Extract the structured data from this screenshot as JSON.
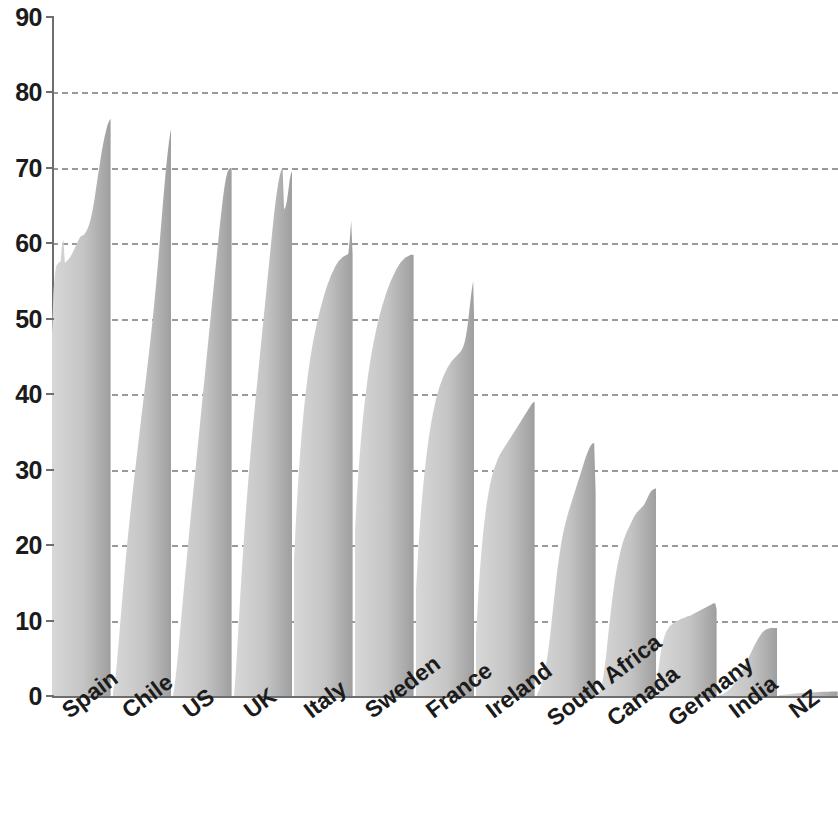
{
  "chart_data": {
    "type": "area",
    "title": "",
    "subtitle": "",
    "xlabel": "",
    "ylabel": "",
    "ylim": [
      0,
      90
    ],
    "xlim": [
      0,
      13
    ],
    "y_ticks": [
      0,
      10,
      20,
      30,
      40,
      50,
      60,
      70,
      80,
      90
    ],
    "y_tick_labels": [
      "0",
      "10",
      "20",
      "30",
      "40",
      "50",
      "60",
      "70",
      "80",
      "90"
    ],
    "grid": true,
    "grid_axis": "y",
    "grid_style": "dashed",
    "grid_color": "#9a9a9a",
    "axis_color": "#6e6e6e",
    "legend": false,
    "legend_position": "none",
    "categories": [
      "Spain",
      "Chile",
      "US",
      "UK",
      "Italy",
      "Sweden",
      "France",
      "Ireland",
      "South Africa",
      "Canada",
      "Germany",
      "India",
      "NZ"
    ],
    "series_note": "Each category is a within-country distribution profile drawn as a filled area rising left to right; values are percentages on the 0-90 axis.",
    "peak_values": [
      76.5,
      75.5,
      70.0,
      70.0,
      63.0,
      58.5,
      55.0,
      39.0,
      33.5,
      27.5,
      12.3,
      9.0,
      0.6
    ],
    "start_values": [
      48.0,
      0.5,
      0.0,
      0.0,
      18.0,
      22.0,
      14.0,
      8.0,
      0.3,
      0.2,
      3.0,
      0.1,
      0.1
    ],
    "series": [
      {
        "name": "Spain",
        "peak": 76.5,
        "profile": [
          48.0,
          53.5,
          56.0,
          57.0,
          57.3,
          57.5,
          57.6,
          59.8,
          60.5,
          57.4,
          57.6,
          57.8,
          58.0,
          58.3,
          58.6,
          59.0,
          59.4,
          59.8,
          60.2,
          60.6,
          60.9,
          61.0,
          61.1,
          61.3,
          61.6,
          62.0,
          62.5,
          63.2,
          64.0,
          65.0,
          66.2,
          67.5,
          68.8,
          70.0,
          71.2,
          72.4,
          73.4,
          74.3,
          75.1,
          75.8,
          76.2,
          76.5
        ]
      },
      {
        "name": "Chile",
        "peak": 75.5,
        "profile": [
          0.5,
          1.5,
          3.0,
          5.0,
          7.2,
          9.5,
          11.8,
          14.0,
          16.2,
          18.3,
          20.3,
          22.2,
          24.0,
          25.8,
          27.5,
          29.2,
          30.8,
          32.4,
          34.0,
          35.6,
          37.2,
          38.8,
          40.4,
          42.0,
          43.6,
          45.2,
          46.9,
          48.6,
          50.4,
          52.3,
          54.3,
          56.4,
          58.6,
          60.9,
          63.2,
          65.5,
          67.7,
          69.8,
          71.6,
          73.2,
          74.6,
          75.5
        ]
      },
      {
        "name": "US",
        "peak": 70.0,
        "profile": [
          0.0,
          1.2,
          2.8,
          4.6,
          6.6,
          8.7,
          10.8,
          12.9,
          15.0,
          17.0,
          19.0,
          21.0,
          23.0,
          24.9,
          26.8,
          28.7,
          30.6,
          32.5,
          34.4,
          36.3,
          38.2,
          40.1,
          42.0,
          43.9,
          45.8,
          47.7,
          49.6,
          51.5,
          53.4,
          55.3,
          57.2,
          59.1,
          61.0,
          62.8,
          64.5,
          66.1,
          67.5,
          68.6,
          69.4,
          69.8,
          70.0,
          70.0
        ]
      },
      {
        "name": "UK",
        "peak": 70.0,
        "profile": [
          0.0,
          2.5,
          5.5,
          8.8,
          12.0,
          15.2,
          18.2,
          21.0,
          23.7,
          26.2,
          28.6,
          30.9,
          33.1,
          35.2,
          37.2,
          39.2,
          41.1,
          43.0,
          44.9,
          46.8,
          48.7,
          50.6,
          52.5,
          54.4,
          56.3,
          58.2,
          60.1,
          62.0,
          63.8,
          65.4,
          66.8,
          68.0,
          69.0,
          69.7,
          70.0,
          64.5,
          64.8,
          65.6,
          67.0,
          68.5,
          69.4,
          69.5
        ]
      },
      {
        "name": "Italy",
        "peak": 63.0,
        "profile": [
          18.0,
          22.0,
          25.5,
          28.6,
          31.4,
          33.9,
          36.1,
          38.1,
          39.9,
          41.5,
          43.0,
          44.3,
          45.5,
          46.6,
          47.6,
          48.5,
          49.4,
          50.2,
          51.0,
          51.7,
          52.4,
          53.1,
          53.7,
          54.3,
          54.8,
          55.3,
          55.8,
          56.2,
          56.6,
          57.0,
          57.3,
          57.6,
          57.8,
          58.0,
          58.2,
          58.3,
          58.4,
          58.5,
          58.6,
          60.5,
          63.0,
          58.5
        ]
      },
      {
        "name": "Sweden",
        "peak": 58.5,
        "profile": [
          22.0,
          25.5,
          28.5,
          31.2,
          33.6,
          35.7,
          37.6,
          39.3,
          40.9,
          42.3,
          43.6,
          44.8,
          45.9,
          46.9,
          47.8,
          48.7,
          49.5,
          50.3,
          51.0,
          51.7,
          52.3,
          52.9,
          53.5,
          54.0,
          54.5,
          55.0,
          55.4,
          55.8,
          56.2,
          56.6,
          56.9,
          57.2,
          57.5,
          57.7,
          57.9,
          58.1,
          58.2,
          58.3,
          58.4,
          58.5,
          58.5,
          58.5
        ]
      },
      {
        "name": "France",
        "peak": 55.0,
        "profile": [
          14.0,
          17.5,
          20.6,
          23.3,
          25.7,
          27.8,
          29.7,
          31.4,
          32.9,
          34.3,
          35.5,
          36.6,
          37.6,
          38.5,
          39.3,
          40.0,
          40.7,
          41.3,
          41.8,
          42.3,
          42.7,
          43.1,
          43.5,
          43.8,
          44.1,
          44.4,
          44.6,
          44.8,
          45.0,
          45.2,
          45.4,
          45.6,
          45.9,
          46.3,
          46.9,
          47.8,
          49.0,
          50.6,
          52.3,
          53.8,
          55.0,
          47.5
        ]
      },
      {
        "name": "Ireland",
        "peak": 39.0,
        "profile": [
          8.0,
          11.5,
          14.6,
          17.3,
          19.6,
          21.6,
          23.3,
          24.8,
          26.1,
          27.2,
          28.2,
          29.0,
          29.7,
          30.3,
          30.8,
          31.3,
          31.7,
          32.1,
          32.4,
          32.7,
          33.0,
          33.3,
          33.6,
          33.9,
          34.2,
          34.5,
          34.8,
          35.1,
          35.4,
          35.7,
          36.0,
          36.3,
          36.6,
          36.9,
          37.2,
          37.5,
          37.8,
          38.1,
          38.4,
          38.7,
          38.9,
          39.0
        ]
      },
      {
        "name": "South Africa",
        "peak": 33.5,
        "profile": [
          0.3,
          0.6,
          1.0,
          1.5,
          2.1,
          2.9,
          3.8,
          4.9,
          6.2,
          7.7,
          9.4,
          11.2,
          13.0,
          14.7,
          16.3,
          17.8,
          19.1,
          20.3,
          21.3,
          22.2,
          23.0,
          23.7,
          24.4,
          25.0,
          25.6,
          26.2,
          26.8,
          27.4,
          28.0,
          28.6,
          29.2,
          29.8,
          30.4,
          31.0,
          31.6,
          32.1,
          32.6,
          33.0,
          33.3,
          33.5,
          33.5,
          27.0
        ]
      },
      {
        "name": "Canada",
        "peak": 27.5,
        "profile": [
          0.2,
          0.5,
          1.0,
          1.8,
          2.9,
          4.3,
          6.0,
          7.8,
          9.6,
          11.3,
          12.9,
          14.3,
          15.6,
          16.7,
          17.7,
          18.6,
          19.4,
          20.1,
          20.7,
          21.2,
          21.7,
          22.1,
          22.5,
          22.9,
          23.3,
          23.7,
          24.0,
          24.3,
          24.5,
          24.7,
          24.9,
          25.1,
          25.3,
          25.6,
          26.0,
          26.4,
          26.8,
          27.1,
          27.3,
          27.4,
          27.5,
          27.5
        ]
      },
      {
        "name": "Germany",
        "peak": 12.3,
        "profile": [
          3.0,
          4.6,
          5.9,
          6.9,
          7.6,
          8.2,
          8.6,
          8.9,
          9.2,
          9.4,
          9.5,
          9.7,
          9.8,
          9.9,
          10.0,
          10.1,
          10.2,
          10.3,
          10.3,
          10.4,
          10.5,
          10.6,
          10.6,
          10.7,
          10.8,
          10.9,
          11.0,
          11.1,
          11.2,
          11.3,
          11.4,
          11.5,
          11.6,
          11.7,
          11.8,
          11.9,
          12.0,
          12.1,
          12.2,
          12.3,
          12.3,
          11.5
        ]
      },
      {
        "name": "India",
        "peak": 9.0,
        "profile": [
          0.1,
          0.15,
          0.2,
          0.3,
          0.4,
          0.5,
          0.65,
          0.8,
          1.0,
          1.2,
          1.45,
          1.7,
          2.0,
          2.3,
          2.6,
          2.95,
          3.3,
          3.65,
          4.0,
          4.4,
          4.8,
          5.2,
          5.6,
          6.0,
          6.4,
          6.8,
          7.1,
          7.5,
          7.8,
          8.1,
          8.35,
          8.55,
          8.7,
          8.8,
          8.9,
          8.95,
          9.0,
          9.0,
          9.0,
          9.0,
          9.0,
          9.0
        ]
      },
      {
        "name": "NZ",
        "peak": 0.6,
        "profile": [
          0.1,
          0.12,
          0.14,
          0.16,
          0.18,
          0.2,
          0.22,
          0.24,
          0.26,
          0.28,
          0.3,
          0.32,
          0.34,
          0.36,
          0.38,
          0.4,
          0.41,
          0.42,
          0.43,
          0.44,
          0.45,
          0.46,
          0.47,
          0.48,
          0.49,
          0.5,
          0.51,
          0.52,
          0.53,
          0.54,
          0.55,
          0.55,
          0.56,
          0.56,
          0.57,
          0.57,
          0.58,
          0.58,
          0.59,
          0.59,
          0.6,
          0.6
        ]
      }
    ]
  },
  "colors": {
    "fill_light": "#d8d8d8",
    "fill_dark": "#9e9e9e",
    "grid": "#9a9a9a",
    "axis": "#6e6e6e",
    "text": "#1b1b1b",
    "background": "#ffffff"
  }
}
